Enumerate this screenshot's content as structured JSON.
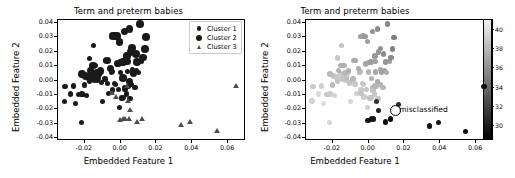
{
  "figure": {
    "width": 515,
    "height": 178,
    "background": "#ffffff"
  },
  "chart_data": [
    {
      "id": "left-panel",
      "type": "scatter",
      "title": "Term and preterm babies",
      "xlabel": "Embedded Feature 1",
      "ylabel": "Embedded Feature 2",
      "xlim": [
        -0.035,
        0.07
      ],
      "ylim": [
        -0.042,
        0.042
      ],
      "xticks": [
        -0.02,
        0.0,
        0.02,
        0.04,
        0.06
      ],
      "xticklabels": [
        "-0.02",
        "0.00",
        "0.02",
        "0.04",
        "0.06"
      ],
      "yticks": [
        -0.04,
        -0.03,
        -0.02,
        -0.01,
        0.0,
        0.01,
        0.02,
        0.03,
        0.04
      ],
      "yticklabels": [
        "-0.04",
        "-0.03",
        "-0.02",
        "-0.01",
        "0.00",
        "0.01",
        "0.02",
        "0.03",
        "0.04"
      ],
      "grid": false,
      "legend_position": "upper right",
      "legend": [
        {
          "label": "Cluster 1",
          "marker": "small-circle",
          "color": "#1a1a1a"
        },
        {
          "label": "Cluster 2",
          "marker": "large-circle",
          "color": "#1a1a1a"
        },
        {
          "label": "Cluster 3",
          "marker": "triangle",
          "color": "#4d4d4d"
        }
      ],
      "series": [
        {
          "name": "Cluster 1",
          "marker": "small-circle",
          "color": "#1a1a1a",
          "size": 2.6,
          "points": [
            [
              -0.0305,
              -0.0047
            ],
            [
              -0.031,
              -0.015
            ],
            [
              -0.0275,
              -0.0101
            ],
            [
              -0.0258,
              -0.0045
            ],
            [
              -0.0245,
              -0.0165
            ],
            [
              -0.0228,
              -0.0103
            ],
            [
              -0.021,
              -0.0101
            ],
            [
              -0.0212,
              -0.0299
            ],
            [
              -0.0196,
              -0.0038
            ],
            [
              -0.0185,
              -0.0112
            ],
            [
              -0.017,
              0.0148
            ],
            [
              -0.0168,
              -0.001
            ],
            [
              -0.0152,
              0.0041
            ],
            [
              -0.0148,
              0.0025
            ],
            [
              -0.0145,
              0.0238
            ],
            [
              -0.0133,
              0.0097
            ],
            [
              -0.0125,
              -0.0007
            ],
            [
              -0.0118,
              0.0011
            ],
            [
              -0.0112,
              0.0033
            ],
            [
              -0.01,
              -0.0023
            ],
            [
              -0.0095,
              -0.0152
            ],
            [
              -0.0082,
              0.0004
            ],
            [
              -0.0078,
              0.0131
            ],
            [
              -0.007,
              -0.003
            ],
            [
              -0.0062,
              -0.0097
            ],
            [
              -0.0046,
              0.0052
            ],
            [
              -0.0042,
              0.0055
            ],
            [
              -0.0038,
              -0.0073
            ],
            [
              -0.003,
              -0.0029
            ],
            [
              -0.0022,
              -0.0034
            ],
            [
              -0.0012,
              0.0102
            ],
            [
              -0.0008,
              -0.0068
            ],
            [
              -0.0002,
              -0.0196
            ],
            [
              0.0006,
              0.0051
            ],
            [
              0.001,
              -0.0128
            ],
            [
              0.0016,
              -0.0132
            ],
            [
              0.002,
              -0.0127
            ],
            [
              0.0026,
              -0.0057
            ],
            [
              0.003,
              -0.0072
            ],
            [
              0.0038,
              -0.0101
            ],
            [
              0.0044,
              0.0053
            ],
            [
              0.005,
              -0.0049
            ],
            [
              0.0058,
              -0.0131
            ],
            [
              0.0068,
              -0.0036
            ],
            [
              0.0072,
              0.0069
            ],
            [
              0.0086,
              -0.0056
            ],
            [
              0.0094,
              0.0063
            ],
            [
              0.0104,
              0.0048
            ],
            [
              0.0122,
              0.0128
            ]
          ]
        },
        {
          "name": "Cluster 2",
          "marker": "large-circle",
          "color": "#1a1a1a",
          "size": 3.8,
          "points": [
            [
              -0.021,
              0.0038
            ],
            [
              -0.019,
              0.0024
            ],
            [
              -0.0175,
              0.0016
            ],
            [
              -0.0163,
              0.0063
            ],
            [
              -0.015,
              0.0098
            ],
            [
              -0.014,
              0.0003
            ],
            [
              -0.0126,
              0.0046
            ],
            [
              -0.0108,
              0.006
            ],
            [
              -0.007,
              0.0131
            ],
            [
              -0.0052,
              0.0075
            ],
            [
              -0.004,
              0.03
            ],
            [
              -0.0026,
              0.0301
            ],
            [
              -0.0015,
              0.03
            ],
            [
              -0.001,
              0.011
            ],
            [
              0.0,
              0.0262
            ],
            [
              0.0008,
              0.0118
            ],
            [
              0.0014,
              0.0119
            ],
            [
              0.0018,
              0.0121
            ],
            [
              0.0028,
              0.0334
            ],
            [
              0.004,
              0.0163
            ],
            [
              0.0042,
              0.0124
            ],
            [
              0.0055,
              0.035
            ],
            [
              0.006,
              0.019
            ],
            [
              0.007,
              0.0217
            ],
            [
              0.0078,
              0.0047
            ],
            [
              0.009,
              0.0177
            ],
            [
              0.0098,
              0.0122
            ],
            [
              0.0112,
              0.0384
            ],
            [
              0.013,
              0.0152
            ],
            [
              0.014,
              0.0213
            ],
            [
              0.0148,
              0.0293
            ],
            [
              0.0056,
              -0.0013
            ],
            [
              0.002,
              0.0009
            ]
          ]
        },
        {
          "name": "Cluster 3",
          "marker": "triangle",
          "color": "#4d4d4d",
          "size": 3.4,
          "points": [
            [
              0.0042,
              -0.0046
            ],
            [
              0.0048,
              -0.0152
            ],
            [
              0.006,
              -0.0215
            ],
            [
              0.0002,
              -0.0283
            ],
            [
              0.002,
              -0.0275
            ],
            [
              0.0034,
              -0.0274
            ],
            [
              0.0055,
              -0.0277
            ],
            [
              0.0098,
              -0.0296
            ],
            [
              0.0128,
              -0.0275
            ],
            [
              0.0345,
              -0.0322
            ],
            [
              0.0395,
              -0.0299
            ],
            [
              0.0548,
              -0.0363
            ],
            [
              0.065,
              -0.0047
            ],
            [
              -0.002,
              -0.0122
            ],
            [
              -0.0038,
              -0.0098
            ]
          ]
        }
      ]
    },
    {
      "id": "right-panel",
      "type": "scatter",
      "title": "Term and preterm babies",
      "xlabel": "Embedded Feature 1",
      "ylabel": "Embedded Feature 2",
      "xlim": [
        -0.035,
        0.07
      ],
      "ylim": [
        -0.042,
        0.042
      ],
      "xticks": [
        -0.02,
        0.0,
        0.02,
        0.04,
        0.06
      ],
      "xticklabels": [
        "-0.02",
        "0.00",
        "0.02",
        "0.04",
        "0.06"
      ],
      "yticks": [
        -0.04,
        -0.03,
        -0.02,
        -0.01,
        0.0,
        0.01,
        0.02,
        0.03,
        0.04
      ],
      "yticklabels": [
        "-0.04",
        "-0.03",
        "-0.02",
        "-0.01",
        "0.00",
        "0.01",
        "0.02",
        "0.03",
        "0.04"
      ],
      "grid": false,
      "colormap": "gray",
      "colorbar": {
        "vmin": 28.5,
        "vmax": 41.0,
        "ticks": [
          30,
          32,
          34,
          36,
          38,
          40
        ],
        "ticklabels": [
          "30",
          "32",
          "34",
          "36",
          "38",
          "40"
        ],
        "orientation": "vertical",
        "top_color": "#f2f2f2",
        "bottom_color": "#000000"
      },
      "annotation": {
        "text": "misclassified",
        "marker": "open-circle",
        "x": 0.0148,
        "y": -0.0208
      },
      "points": [
        [
          -0.0305,
          -0.0047,
          39.0
        ],
        [
          -0.031,
          -0.015,
          39.4
        ],
        [
          -0.0275,
          -0.0101,
          39.8
        ],
        [
          -0.0258,
          -0.0045,
          39.2
        ],
        [
          -0.0245,
          -0.0165,
          40.0
        ],
        [
          -0.0228,
          -0.0103,
          38.6
        ],
        [
          -0.021,
          -0.0101,
          39.0
        ],
        [
          -0.0212,
          -0.0299,
          39.6
        ],
        [
          -0.0196,
          -0.0038,
          38.2
        ],
        [
          -0.0185,
          -0.0112,
          39.4
        ],
        [
          -0.017,
          0.0148,
          38.8
        ],
        [
          -0.0168,
          -0.001,
          38.4
        ],
        [
          -0.0152,
          0.0041,
          38.0
        ],
        [
          -0.0148,
          0.0025,
          39.0
        ],
        [
          -0.0145,
          0.0238,
          38.6
        ],
        [
          -0.0133,
          0.0097,
          37.8
        ],
        [
          -0.0125,
          -0.0007,
          38.8
        ],
        [
          -0.0118,
          0.0011,
          38.2
        ],
        [
          -0.0112,
          0.0033,
          39.2
        ],
        [
          -0.01,
          -0.0023,
          38.6
        ],
        [
          -0.0095,
          -0.0152,
          39.6
        ],
        [
          -0.0082,
          0.0004,
          38.0
        ],
        [
          -0.0078,
          0.0131,
          37.6
        ],
        [
          -0.007,
          -0.003,
          38.8
        ],
        [
          -0.0062,
          -0.0097,
          39.2
        ],
        [
          -0.0046,
          0.0052,
          37.8
        ],
        [
          -0.0042,
          0.0055,
          38.2
        ],
        [
          -0.0038,
          -0.0073,
          39.0
        ],
        [
          -0.003,
          -0.0029,
          38.4
        ],
        [
          -0.0022,
          -0.0034,
          38.8
        ],
        [
          -0.0012,
          0.0102,
          37.4
        ],
        [
          -0.0008,
          -0.0068,
          38.6
        ],
        [
          -0.0002,
          -0.0196,
          39.2
        ],
        [
          0.0006,
          0.0051,
          37.8
        ],
        [
          0.001,
          -0.0128,
          38.8
        ],
        [
          0.0016,
          -0.0132,
          38.4
        ],
        [
          0.002,
          -0.0127,
          38.6
        ],
        [
          0.0026,
          -0.0057,
          38.0
        ],
        [
          0.003,
          -0.0072,
          38.4
        ],
        [
          0.0038,
          -0.0101,
          38.8
        ],
        [
          0.0044,
          0.0053,
          37.2
        ],
        [
          0.005,
          -0.0049,
          38.2
        ],
        [
          0.0058,
          -0.0131,
          38.6
        ],
        [
          0.0068,
          -0.0036,
          37.8
        ],
        [
          0.0072,
          0.0069,
          37.0
        ],
        [
          0.0086,
          -0.0056,
          38.0
        ],
        [
          0.0094,
          0.0063,
          36.8
        ],
        [
          0.0104,
          0.0048,
          37.4
        ],
        [
          0.0122,
          0.0128,
          36.6
        ],
        [
          -0.021,
          0.0038,
          38.2
        ],
        [
          -0.019,
          0.0024,
          38.4
        ],
        [
          -0.0175,
          0.0016,
          38.8
        ],
        [
          -0.0163,
          0.0063,
          37.8
        ],
        [
          -0.015,
          0.0098,
          37.6
        ],
        [
          -0.014,
          0.0003,
          38.6
        ],
        [
          -0.0126,
          0.0046,
          38.0
        ],
        [
          -0.0108,
          0.006,
          37.6
        ],
        [
          -0.007,
          0.0131,
          37.2
        ],
        [
          -0.0052,
          0.0075,
          37.4
        ],
        [
          -0.004,
          0.03,
          36.6
        ],
        [
          -0.0026,
          0.0301,
          36.8
        ],
        [
          -0.0015,
          0.03,
          36.4
        ],
        [
          -0.001,
          0.011,
          37.0
        ],
        [
          0.0,
          0.0262,
          36.6
        ],
        [
          0.0008,
          0.0118,
          36.8
        ],
        [
          0.0014,
          0.0119,
          37.0
        ],
        [
          0.0018,
          0.0121,
          36.6
        ],
        [
          0.0028,
          0.0334,
          36.0
        ],
        [
          0.004,
          0.0163,
          36.4
        ],
        [
          0.0042,
          0.0124,
          36.8
        ],
        [
          0.0055,
          0.035,
          35.8
        ],
        [
          0.006,
          0.019,
          36.2
        ],
        [
          0.007,
          0.0217,
          36.0
        ],
        [
          0.0078,
          0.0047,
          36.8
        ],
        [
          0.009,
          0.0177,
          35.8
        ],
        [
          0.0098,
          0.0122,
          36.2
        ],
        [
          0.0112,
          0.0384,
          35.4
        ],
        [
          0.013,
          0.0152,
          35.6
        ],
        [
          0.014,
          0.0213,
          35.2
        ],
        [
          0.0148,
          0.0293,
          35.0
        ],
        [
          0.0056,
          -0.0013,
          37.4
        ],
        [
          0.002,
          0.0009,
          37.6
        ],
        [
          0.0042,
          -0.0046,
          37.8
        ],
        [
          -0.002,
          -0.0122,
          39.0
        ],
        [
          -0.0038,
          -0.0098,
          38.6
        ],
        [
          0.0048,
          -0.0152,
          31.0
        ],
        [
          0.006,
          -0.0215,
          30.2
        ],
        [
          0.0002,
          -0.0283,
          29.6
        ],
        [
          0.002,
          -0.0275,
          29.4
        ],
        [
          0.0034,
          -0.0274,
          29.8
        ],
        [
          0.0098,
          -0.0296,
          29.2
        ],
        [
          0.0128,
          -0.0275,
          29.0
        ],
        [
          0.0345,
          -0.0322,
          29.4
        ],
        [
          0.0395,
          -0.0299,
          29.6
        ],
        [
          0.0548,
          -0.0363,
          29.0
        ],
        [
          0.065,
          -0.0047,
          29.2
        ],
        [
          0.0172,
          -0.0175,
          30.6
        ]
      ]
    }
  ]
}
